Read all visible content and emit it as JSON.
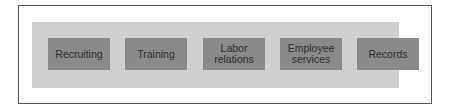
{
  "diagram": {
    "type": "functional-blocks",
    "colors": {
      "frame_border": "#555555",
      "band_fill": "#cfcfcf",
      "box_fill": "#8a8a8a",
      "text": "#2e2e2e"
    },
    "boxes": [
      {
        "label": "Recruiting"
      },
      {
        "label": "Training"
      },
      {
        "label_line1": "Labor",
        "label_line2": "relations"
      },
      {
        "label_line1": "Employee",
        "label_line2": "services"
      },
      {
        "label": "Records"
      }
    ]
  }
}
